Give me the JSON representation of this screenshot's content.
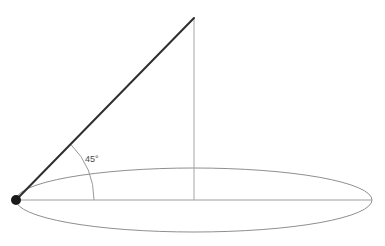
{
  "figure": {
    "background_color": "#ffffff",
    "width": 385,
    "height": 246
  },
  "labels": {
    "angle": "45°"
  },
  "colors": {
    "slant_line": "#2f2f2f",
    "axis_line": "#a6a6a6",
    "base_line": "#9e9e9e",
    "ellipse_stroke": "#8f8f8f",
    "arc_stroke": "#9a9a9a",
    "vertex_fill": "#1a1a1a",
    "label_text": "#4a4a4a"
  },
  "chart_data": {
    "type": "diagram",
    "grid": false,
    "legend": null,
    "xlabel": "",
    "ylabel": "",
    "annotations": [
      {
        "name": "angle-measure",
        "text": "45°",
        "x": 85,
        "y": 158,
        "value": 45,
        "unit": "degrees"
      }
    ],
    "points": [
      {
        "name": "vertex",
        "x": 16,
        "y": 200,
        "marker": "filled-dot",
        "radius": 5
      },
      {
        "name": "apex",
        "x": 194,
        "y": 18,
        "marker": "none"
      },
      {
        "name": "base-center",
        "x": 194,
        "y": 200,
        "marker": "none"
      },
      {
        "name": "base-right",
        "x": 372,
        "y": 200,
        "marker": "none"
      }
    ],
    "segments": [
      {
        "name": "slant-line",
        "x1": 16,
        "y1": 200,
        "x2": 194,
        "y2": 18,
        "stroke": "#2f2f2f",
        "width": 2.0
      },
      {
        "name": "vertical-axis",
        "x1": 194,
        "y1": 18,
        "x2": 194,
        "y2": 200,
        "stroke": "#a6a6a6",
        "width": 1.0
      },
      {
        "name": "base-diameter",
        "x1": 16,
        "y1": 200,
        "x2": 372,
        "y2": 200,
        "stroke": "#9e9e9e",
        "width": 1.0
      }
    ],
    "ellipses": [
      {
        "name": "base-circle",
        "cx": 194,
        "cy": 200,
        "rx": 178,
        "ry": 32,
        "stroke": "#8f8f8f",
        "width": 1.0,
        "fill": "none"
      }
    ],
    "arcs": [
      {
        "name": "angle-arc",
        "cx": 16,
        "cy": 200,
        "radius": 78,
        "start_angle_deg": 0,
        "end_angle_deg": 45,
        "stroke": "#9a9a9a",
        "width": 1.0
      }
    ]
  }
}
